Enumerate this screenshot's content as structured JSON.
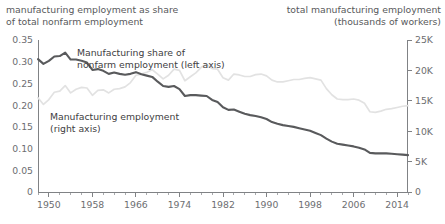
{
  "header": {
    "left": "manufacturing employment as share\nof total nonfarm employment",
    "right": "total manufacturing employment\n(thousands of workers)"
  },
  "annotations": {
    "share_label": "Manufacturing share of\nnonfarm employment (left axis)",
    "level_label": "Manufacturing employment\n(right axis)"
  },
  "colors": {
    "share_line": "#595a5c",
    "level_line": "#e2e2e2",
    "axis": "#808285",
    "text": "#58595b"
  },
  "chart_data": {
    "type": "line",
    "title": "",
    "xlabel": "",
    "ylabel": "manufacturing employment as share of total nonfarm employment",
    "y2label": "total manufacturing employment (thousands of workers)",
    "grid": false,
    "legend": "annotations",
    "xlim": [
      1948,
      2016
    ],
    "ylim": [
      0,
      0.35
    ],
    "y2lim": [
      0,
      25000
    ],
    "xticks": [
      1950,
      1958,
      1966,
      1974,
      1982,
      1990,
      1998,
      2006,
      2014
    ],
    "xtick_labels": [
      "1950",
      "1958",
      "1966",
      "1974",
      "1982",
      "1990",
      "1998",
      "2006",
      "2014"
    ],
    "xminor_step": 2,
    "yticks": [
      0,
      0.05,
      0.1,
      0.15,
      0.2,
      0.25,
      0.3,
      0.35
    ],
    "ytick_labels": [
      "0",
      "0.05",
      "0.10",
      "0.15",
      "0.20",
      "0.25",
      "0.30",
      "0.35"
    ],
    "y2ticks": [
      0,
      5000,
      10000,
      15000,
      20000,
      25000
    ],
    "y2tick_labels": [
      "0",
      "5K",
      "10K",
      "15K",
      "20K",
      "25K"
    ],
    "x": [
      1948,
      1949,
      1950,
      1951,
      1952,
      1953,
      1954,
      1955,
      1956,
      1957,
      1958,
      1959,
      1960,
      1961,
      1962,
      1963,
      1964,
      1965,
      1966,
      1967,
      1968,
      1969,
      1970,
      1971,
      1972,
      1973,
      1974,
      1975,
      1976,
      1977,
      1978,
      1979,
      1980,
      1981,
      1982,
      1983,
      1984,
      1985,
      1986,
      1987,
      1988,
      1989,
      1990,
      1991,
      1992,
      1993,
      1994,
      1995,
      1996,
      1997,
      1998,
      1999,
      2000,
      2001,
      2002,
      2003,
      2004,
      2005,
      2006,
      2007,
      2008,
      2009,
      2010,
      2011,
      2012,
      2013,
      2014,
      2015,
      2016
    ],
    "series": [
      {
        "name": "Manufacturing share of nonfarm employment (left axis)",
        "axis": "left",
        "color": "#595a5c",
        "values": [
          0.306,
          0.295,
          0.302,
          0.312,
          0.313,
          0.321,
          0.305,
          0.305,
          0.302,
          0.298,
          0.281,
          0.283,
          0.279,
          0.272,
          0.275,
          0.272,
          0.27,
          0.272,
          0.276,
          0.271,
          0.268,
          0.265,
          0.254,
          0.244,
          0.242,
          0.244,
          0.237,
          0.221,
          0.223,
          0.223,
          0.222,
          0.221,
          0.212,
          0.207,
          0.195,
          0.189,
          0.19,
          0.185,
          0.18,
          0.177,
          0.175,
          0.172,
          0.168,
          0.161,
          0.157,
          0.154,
          0.152,
          0.15,
          0.147,
          0.144,
          0.141,
          0.136,
          0.131,
          0.123,
          0.116,
          0.111,
          0.109,
          0.107,
          0.105,
          0.102,
          0.098,
          0.09,
          0.089,
          0.089,
          0.089,
          0.088,
          0.087,
          0.086,
          0.085
        ]
      },
      {
        "name": "Manufacturing employment (right axis)",
        "axis": "right",
        "color": "#e2e2e2",
        "values": [
          15500,
          14400,
          15200,
          16400,
          16600,
          17500,
          16300,
          16900,
          17200,
          17100,
          15900,
          16700,
          16800,
          16300,
          16900,
          17000,
          17300,
          18000,
          19200,
          19400,
          19700,
          20100,
          19400,
          18600,
          19200,
          20200,
          20000,
          18300,
          18950,
          19600,
          20500,
          21000,
          20300,
          20200,
          18800,
          18400,
          19400,
          19250,
          19000,
          19000,
          19300,
          19400,
          19100,
          18400,
          18100,
          18100,
          18300,
          18500,
          18500,
          18700,
          18800,
          18600,
          18400,
          17000,
          16000,
          15300,
          15200,
          15200,
          15300,
          15100,
          14600,
          13200,
          13100,
          13300,
          13600,
          13700,
          13900,
          14100,
          14200
        ]
      }
    ]
  }
}
